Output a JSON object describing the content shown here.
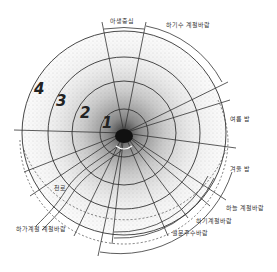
{
  "diagram": {
    "type": "concentric-zone-diagram",
    "style": "hand-drawn sketch, stippled shading darker toward center",
    "center": {
      "x": 124,
      "y": 133
    },
    "rings": [
      {
        "label": "1",
        "radius": 24
      },
      {
        "label": "2",
        "radius": 52
      },
      {
        "label": "3",
        "radius": 76
      },
      {
        "label": "4",
        "radius": 102
      }
    ],
    "labels": {
      "top_sector": "아생중심",
      "top_right_arc": "하기수 계절바람",
      "right_upper": "여름 밤",
      "right_lower": "겨울 밤",
      "bottom_right_1": "하늘 계절바람",
      "bottom_right_2": "하기계절바람",
      "bottom_right_3": "설문주수바람",
      "bottom_left_road": "천로",
      "bottom_left_arc": "하가계절 계절바람"
    },
    "colors": {
      "ink": "#333333",
      "stipple": "#555555",
      "background": "#ffffff"
    }
  }
}
